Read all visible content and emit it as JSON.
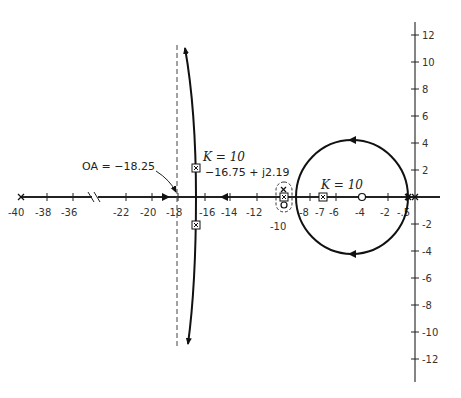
{
  "diagram": {
    "type": "root-locus",
    "x_axis": {
      "tick_labels": [
        "-40",
        "-38",
        "-36",
        "-22",
        "-20",
        "-18",
        "-16",
        "-14",
        "-12",
        "-10",
        "-8",
        "-7",
        "-6",
        "-4",
        "-2",
        "-.5"
      ],
      "axis_break": "between -36 and -22"
    },
    "y_axis": {
      "tick_labels_pos": [
        "2",
        "4",
        "6",
        "8",
        "10",
        "12"
      ],
      "tick_labels_neg": [
        "-2",
        "-4",
        "-6",
        "-8",
        "-10",
        "-12"
      ]
    },
    "annotations": {
      "asymptote": "OA = −18.25",
      "k_label_left": "K = 10",
      "point_left": "−16.75 + j2.19",
      "k_label_right": "K = 10"
    },
    "markers": {
      "poles": [
        "-40",
        "-10",
        "0",
        "-0.5"
      ],
      "zeros": [
        "-4",
        "-10"
      ],
      "closed_loop_K10": [
        "-16.75+j2.19",
        "-16.75-j2.19",
        "-10",
        "-7"
      ]
    }
  }
}
